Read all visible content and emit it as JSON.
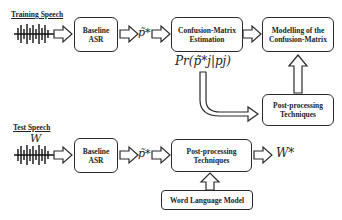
{
  "training": {
    "section_label": "Training Speech",
    "baseline_asr": "Baseline\nASR",
    "intermediate_symbol": "p̃*",
    "confusion_estimation": "Confusion-Matrix\nEstimation",
    "probability_label": "Pr(p̃*j|pj)",
    "modelling": "Modelling of the\nConfusion-Matrix",
    "post_processing": "Post-processing\nTechniques"
  },
  "test": {
    "section_label": "Test Speech",
    "input_symbol": "W",
    "baseline_asr": "Baseline\nASR",
    "intermediate_symbol": "p̃*",
    "post_processing": "Post-processing\nTechniques",
    "output_symbol": "W*",
    "language_model": "Word Language Model"
  },
  "colors": {
    "stroke": "#2a2a2a",
    "background": "#ffffff"
  }
}
